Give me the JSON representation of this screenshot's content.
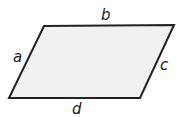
{
  "diagram": {
    "shape": "parallelogram",
    "fill_color": "#f1f1f1",
    "stroke_color": "#222222",
    "labels": {
      "top": "b",
      "left": "a",
      "right": "c",
      "bottom": "d"
    }
  }
}
